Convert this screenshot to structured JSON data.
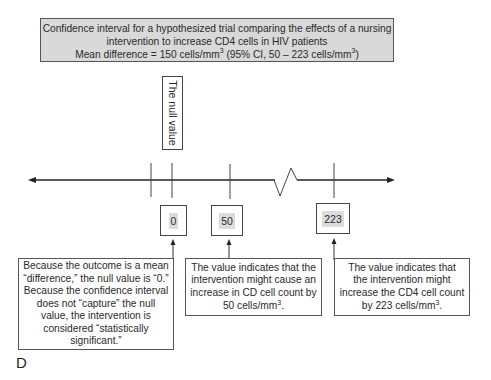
{
  "title_box": {
    "line1": "Confidence interval for a hypothesized trial comparing the effects of a nursing",
    "line2": "intervention to increase CD4 cells in HIV patients",
    "line3_prefix": "Mean difference = 150 cells/mm",
    "line3_sup1": "3",
    "line3_middle": " (95% CI,  50 – 223 cells/mm",
    "line3_sup2": "3",
    "line3_suffix": ")"
  },
  "null_label": "The null value",
  "axis": {
    "break_symbol": "zigzag",
    "ticks": [
      "",
      "0",
      "50",
      "223"
    ]
  },
  "value_boxes": [
    {
      "label": "0"
    },
    {
      "label": "50"
    },
    {
      "label": "223"
    }
  ],
  "notes": {
    "left": {
      "lines": [
        "Because the outcome is a mean",
        "“difference,” the null value is “0.”",
        "Because the confidence interval",
        "does not “capture” the null",
        "value, the intervention is",
        "considered “statistically",
        "significant.”"
      ]
    },
    "middle": {
      "lines": [
        "The value indicates that the",
        "intervention might cause an",
        "increase in CD cell count by"
      ],
      "last_prefix": "50 cells/mm",
      "last_sup": "3",
      "last_suffix": "."
    },
    "right": {
      "lines": [
        "The value indicates that",
        "the intervention might",
        "increase the CD4 cell count"
      ],
      "last_prefix": "by 223 cells/mm",
      "last_sup": "3",
      "last_suffix": "."
    }
  },
  "panel_letter": "D",
  "colors": {
    "title_bg": "#d9d9d9",
    "number_highlight": "#dcdcdc",
    "line": "#222222"
  }
}
